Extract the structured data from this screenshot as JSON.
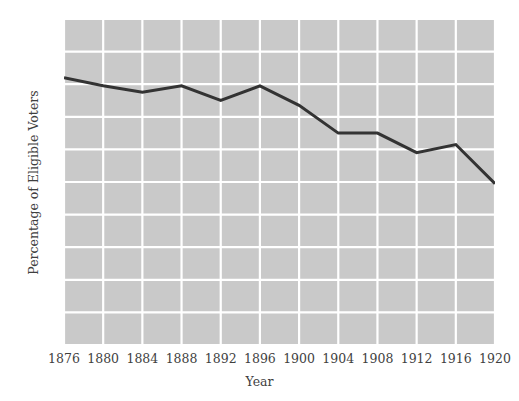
{
  "chart_data": {
    "type": "line",
    "title": "",
    "xlabel": "Year",
    "ylabel": "Percentage of Eligible Voters",
    "x": [
      1876,
      1880,
      1884,
      1888,
      1892,
      1896,
      1900,
      1904,
      1908,
      1912,
      1916,
      1920
    ],
    "values": [
      82,
      79.5,
      77.5,
      79.5,
      75,
      79.5,
      73.5,
      65,
      65,
      59,
      61.5,
      49.5
    ],
    "xticks": [
      "1876",
      "1880",
      "1884",
      "1888",
      "1892",
      "1896",
      "1900",
      "1904",
      "1908",
      "1912",
      "1916",
      "1920"
    ],
    "yticks": [
      "0",
      "10",
      "20",
      "30",
      "40",
      "50",
      "60",
      "70",
      "80",
      "90",
      "100"
    ],
    "xlim": [
      1876,
      1920
    ],
    "ylim": [
      0,
      100
    ],
    "grid": true,
    "legend": "none",
    "colors": {
      "plot_background": "#c9c9c9",
      "gridline": "#ffffff",
      "line": "#333333",
      "text": "#3f3f3f",
      "figure_background": "#ffffff"
    },
    "line_width": 3
  }
}
